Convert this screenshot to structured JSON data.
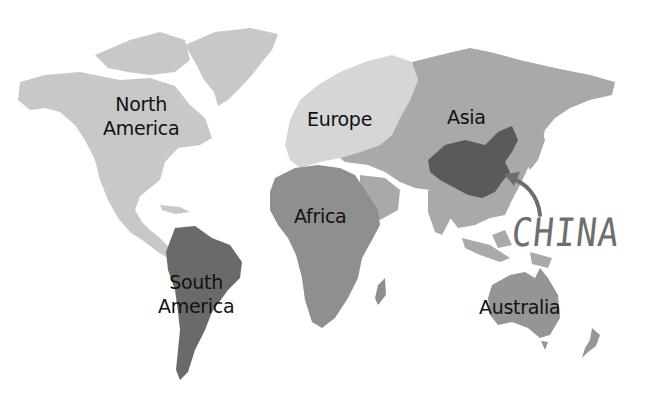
{
  "map": {
    "title": "World continents with China highlighted",
    "colors": {
      "background": "#ffffff",
      "north_america": "#c8c8c8",
      "europe": "#d6d6d6",
      "asia": "#a9a9a9",
      "africa": "#8f8f8f",
      "south_america": "#6a6a6a",
      "australia": "#959595",
      "china": "#5a5a5a",
      "arrow": "#6e6e6e",
      "label_text": "#111111"
    },
    "labels": {
      "north_america_line1": "North",
      "north_america_line2": "America",
      "europe": "Europe",
      "asia": "Asia",
      "africa": "Africa",
      "south_america_line1": "South",
      "south_america_line2": "America",
      "australia": "Australia",
      "china": "CHINA"
    }
  }
}
